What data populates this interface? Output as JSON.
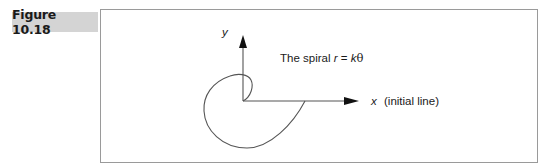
{
  "figure": {
    "label": "Figure 10.18",
    "label_background": "#d4d4d4",
    "border_color": "#9a9a9a"
  },
  "diagram": {
    "title_prefix": "The spiral ",
    "title_r": "r",
    "title_eq": " = ",
    "title_k": "k",
    "title_theta": "θ",
    "y_axis_label": "y",
    "x_axis_label": "x",
    "x_axis_note": "(initial line)",
    "curve_description": "Spiral traced from the image; not plotted from r = kθ because the drawn proportions do not match a true Archimedean spiral",
    "line_color": "#555555",
    "arrow_color": "#111111"
  }
}
